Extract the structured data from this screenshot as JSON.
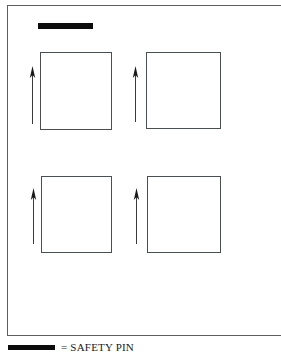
{
  "figure": {
    "background_color": "#ffffff",
    "frame": {
      "name": "figure-border",
      "stroke_color": "#5a5f63"
    },
    "pin_bar": {
      "label": "safety pin bar",
      "color": "#0c0c0c"
    },
    "cells": [
      {
        "id": "top-left",
        "label": "panel 1"
      },
      {
        "id": "top-right",
        "label": "panel 2"
      },
      {
        "id": "bottom-left",
        "label": "panel 3"
      },
      {
        "id": "bottom-right",
        "label": "panel 4"
      }
    ],
    "arrows": [
      {
        "id": "arrow-top-left",
        "direction": "up",
        "color": "#3a3a3a"
      },
      {
        "id": "arrow-top-right",
        "direction": "up",
        "color": "#3a3a3a"
      },
      {
        "id": "arrow-bottom-left",
        "direction": "up",
        "color": "#3a3a3a"
      },
      {
        "id": "arrow-bottom-right",
        "direction": "up",
        "color": "#3a3a3a"
      }
    ],
    "legend": {
      "swatch_color": "#0c0c0c",
      "text": "= SAFETY PIN"
    }
  }
}
